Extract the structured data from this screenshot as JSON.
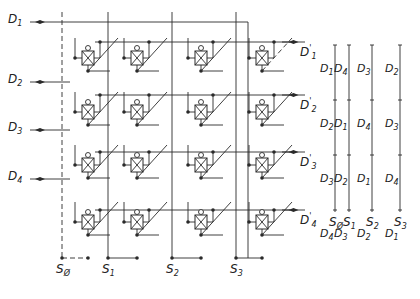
{
  "diagram": {
    "inputs": [
      {
        "name": "D",
        "sub": "1",
        "y": 22
      },
      {
        "name": "D",
        "sub": "2",
        "y": 82
      },
      {
        "name": "D",
        "sub": "3",
        "y": 130
      },
      {
        "name": "D",
        "sub": "4",
        "y": 179
      }
    ],
    "outputs": [
      {
        "name": "D",
        "sub": "1",
        "prime": "'",
        "y": 42
      },
      {
        "name": "D",
        "sub": "2",
        "prime": "'",
        "y": 95
      },
      {
        "name": "D",
        "sub": "3",
        "prime": "'",
        "y": 152
      },
      {
        "name": "D",
        "sub": "4",
        "prime": "'",
        "y": 210
      }
    ],
    "selects": [
      {
        "name": "S",
        "sub": "Ø",
        "x": 62,
        "dashed": true
      },
      {
        "name": "S",
        "sub": "1",
        "x": 108,
        "dashed": false
      },
      {
        "name": "S",
        "sub": "2",
        "x": 172,
        "dashed": false
      },
      {
        "name": "S",
        "sub": "3",
        "x": 236,
        "dashed": false
      }
    ],
    "switch_cell": {
      "symbol": "crossed-box",
      "gate_marker": "circle"
    },
    "truth_table": {
      "columns": [
        {
          "select": "SØ",
          "sub": "Ø",
          "values": [
            "D1",
            "D2",
            "D3",
            "D4"
          ]
        },
        {
          "select": "S1",
          "sub": "1",
          "values": [
            "D4",
            "D1",
            "D2",
            "D3"
          ]
        },
        {
          "select": "S2",
          "sub": "2",
          "values": [
            "D3",
            "D4",
            "D1",
            "D2"
          ]
        },
        {
          "select": "S3",
          "sub": "3",
          "values": [
            "D2",
            "D3",
            "D4",
            "D1"
          ]
        }
      ]
    },
    "colors": {
      "line": "#2a2a2a",
      "background": "#ffffff"
    }
  }
}
